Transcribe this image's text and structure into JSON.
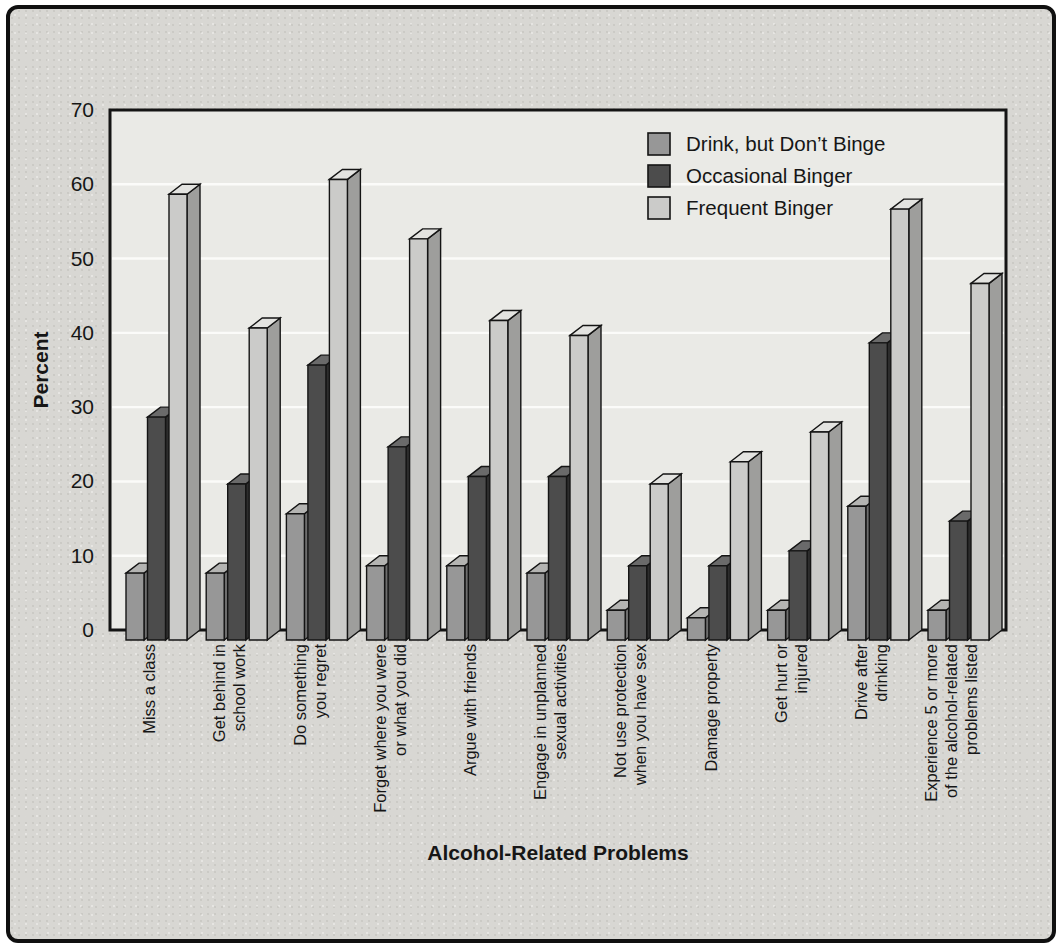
{
  "figure": {
    "outer_background": "#ffffff",
    "frame_border_color": "#101010",
    "paper_color": "#d8d7d3"
  },
  "chart_data": {
    "type": "bar",
    "style": "3d-extruded-vertical-bars",
    "title": "",
    "xlabel": "Alcohol-Related Problems",
    "ylabel": "Percent",
    "ylim": [
      0,
      70
    ],
    "ytick_interval": 10,
    "ytick_labels": [
      "0",
      "10",
      "20",
      "30",
      "40",
      "50",
      "60",
      "70"
    ],
    "grid": true,
    "legend_position": "top-right-inside",
    "categories": [
      "Miss a class",
      "Get behind in school work",
      "Do something you regret",
      "Forget where you were or what you did",
      "Argue with friends",
      "Engage in unplanned sexual activities",
      "Not use protection when you have sex",
      "Damage property",
      "Get hurt or injured",
      "Drive after drinking",
      "Experience 5 or more of the alcohol-related problems listed"
    ],
    "category_label_lines": [
      [
        "Miss a class"
      ],
      [
        "Get behind in",
        "school work"
      ],
      [
        "Do something",
        "you regret"
      ],
      [
        "Forget where you were",
        "or what you did"
      ],
      [
        "Argue with friends"
      ],
      [
        "Engage in unplanned",
        "sexual activities"
      ],
      [
        "Not use protection",
        "when you have sex"
      ],
      [
        "Damage property"
      ],
      [
        "Get hurt or",
        "injured"
      ],
      [
        "Drive after",
        "drinking"
      ],
      [
        "Experience 5 or more",
        "of the alcohol-related",
        "problems listed"
      ]
    ],
    "series": [
      {
        "name": "Drink, but Don’t Binge",
        "color": "#979797",
        "side_color": "#6e6e6e",
        "top_color": "#b4b4b2",
        "values": [
          9,
          9,
          17,
          10,
          10,
          9,
          4,
          3,
          4,
          18,
          4
        ]
      },
      {
        "name": "Occasional Binger",
        "color": "#4c4c4c",
        "side_color": "#2d2d2d",
        "top_color": "#6a6a6a",
        "values": [
          30,
          21,
          37,
          26,
          22,
          22,
          10,
          10,
          12,
          40,
          16
        ]
      },
      {
        "name": "Frequent Binger",
        "color": "#cbcbc9",
        "side_color": "#9e9e9c",
        "top_color": "#e3e3e0",
        "values": [
          60,
          42,
          62,
          54,
          43,
          41,
          21,
          24,
          28,
          58,
          48
        ]
      }
    ],
    "colors": {
      "plot_background": "#eaeae6",
      "gridline": "#fbfbf9",
      "axis_frame": "#141414",
      "text": "#161616"
    }
  }
}
